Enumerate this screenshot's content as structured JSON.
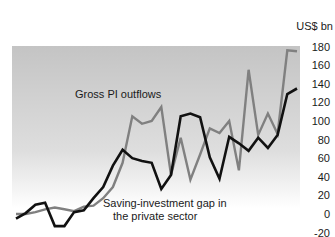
{
  "chart_data": {
    "type": "line",
    "title": "",
    "xlabel": "",
    "ylabel": "US$ bn",
    "ylim": [
      -20,
      180
    ],
    "yticks": [
      180,
      160,
      140,
      120,
      100,
      80,
      60,
      40,
      20,
      0,
      -20
    ],
    "ytick_labels": [
      "180",
      "160",
      "140",
      "120",
      "100",
      "80",
      "60",
      "40",
      "20",
      "0",
      "-20"
    ],
    "grid": false,
    "legend": "none (inline annotations)",
    "series": [
      {
        "name": "Gross PI outflows",
        "color": "#808080",
        "values": [
          0,
          0,
          2,
          5,
          7,
          5,
          3,
          8,
          9,
          17,
          29,
          55,
          105,
          97,
          100,
          115,
          42,
          82,
          37,
          64,
          92,
          87,
          100,
          47,
          155,
          85,
          108,
          86,
          176,
          175
        ]
      },
      {
        "name": "Saving-investment gap in the private sector",
        "color": "#111111",
        "values": [
          -5,
          1,
          10,
          12,
          -13,
          -13,
          2,
          4,
          17,
          29,
          52,
          69,
          60,
          57,
          55,
          27,
          42,
          105,
          108,
          104,
          61,
          38,
          83,
          76,
          68,
          82,
          71,
          85,
          129,
          135
        ]
      }
    ],
    "annotations": [
      {
        "text": "Gross PI outflows",
        "series": 0
      },
      {
        "text": "Saving-investment gap in",
        "series": 1,
        "line": 1
      },
      {
        "text": "the private sector",
        "series": 1,
        "line": 2
      }
    ],
    "background": {
      "top": "#c4c4c4",
      "bottom": "#ffffff"
    }
  }
}
